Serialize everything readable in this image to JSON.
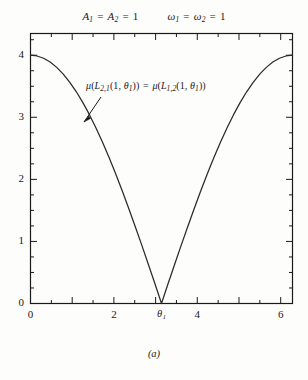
{
  "figure": {
    "caption": "(a)",
    "title_params": [
      {
        "symbol": "A",
        "sub1": "1",
        "symbol2": "A",
        "sub2": "2",
        "value": "1"
      },
      {
        "symbol": "ω",
        "sub1": "1",
        "symbol2": "ω",
        "sub2": "2",
        "value": "1"
      }
    ],
    "title_a_text": "A₁ = A₂ = 1",
    "title_omega_text": "ω₁ = ω₂ = 1",
    "annotation": "μ(L₂,₁(1, θ₁)) = μ(L₁,₂(1, θ₁))",
    "annotation_parts": {
      "mu": "μ",
      "left_term": "L",
      "left_sub": "2,1",
      "right_term": "L",
      "right_sub": "1,2",
      "arg_one": "1",
      "arg_theta": "θ",
      "arg_theta_sub": "1",
      "equals": "="
    }
  },
  "chart_data": {
    "type": "line",
    "subtitle": "",
    "xlabel": "θ₁",
    "ylabel": "",
    "xlim": [
      0,
      6.2832
    ],
    "ylim": [
      0,
      4.35
    ],
    "grid": false,
    "legend": null,
    "x_ticks_major": [
      0,
      1,
      2,
      3,
      4,
      5,
      6
    ],
    "x_ticks_labeled": [
      {
        "value": 0,
        "label": "0"
      },
      {
        "value": 2,
        "label": "2"
      },
      {
        "value": 3.1416,
        "label": "θ₁"
      },
      {
        "value": 4,
        "label": "4"
      },
      {
        "value": 6,
        "label": "6"
      }
    ],
    "x_tick_minor_step": 0.5,
    "y_ticks_major": [
      0,
      1,
      2,
      3,
      4
    ],
    "y_ticks_labeled": [
      {
        "value": 0,
        "label": "0"
      },
      {
        "value": 1,
        "label": "1"
      },
      {
        "value": 2,
        "label": "2"
      },
      {
        "value": 3,
        "label": "3"
      },
      {
        "value": 4,
        "label": "4"
      }
    ],
    "y_tick_minor_step": 0.25,
    "formula": "y = 4*|cos(x/2)|",
    "annotations": [
      {
        "text": "μ(L₂,₁(1, θ₁)) = μ(L₁,₂(1, θ₁))",
        "x": 0.66,
        "y": 3.62,
        "arrow_to_x": 0.95,
        "arrow_to_y": 2.93
      }
    ],
    "series": [
      {
        "name": "μ(L₂,₁(1, θ₁))",
        "color": "#1a1a1a",
        "x": [
          0,
          0.1571,
          0.3142,
          0.4712,
          0.6283,
          0.7854,
          0.9425,
          1.0996,
          1.2566,
          1.4137,
          1.5708,
          1.7279,
          1.885,
          2.042,
          2.1991,
          2.3562,
          2.5133,
          2.6704,
          2.8274,
          2.9845,
          3.1416,
          3.2987,
          3.4558,
          3.6128,
          3.7699,
          3.927,
          4.0841,
          4.2412,
          4.3982,
          4.5553,
          4.7124,
          4.8695,
          5.0265,
          5.1836,
          5.3407,
          5.4978,
          5.6549,
          5.8119,
          5.969,
          6.1261,
          6.2832
        ],
        "y": [
          4.0,
          3.9877,
          3.9507,
          3.8896,
          3.8042,
          3.6955,
          3.564,
          3.4112,
          3.2361,
          3.0423,
          2.8284,
          2.5981,
          2.3511,
          2.0906,
          1.8159,
          1.5307,
          1.2361,
          0.9359,
          0.6282,
          0.3174,
          0.0,
          0.3174,
          0.6282,
          0.9359,
          1.2361,
          1.5307,
          1.8159,
          2.0906,
          2.3511,
          2.5981,
          2.8284,
          3.0423,
          3.2361,
          3.4112,
          3.564,
          3.6955,
          3.8042,
          3.8896,
          3.9507,
          3.9877,
          4.0
        ]
      }
    ]
  },
  "colors": {
    "ink": "#1a1a1a",
    "paper": "#fdfdfc",
    "curve": "#2a2a2a"
  }
}
